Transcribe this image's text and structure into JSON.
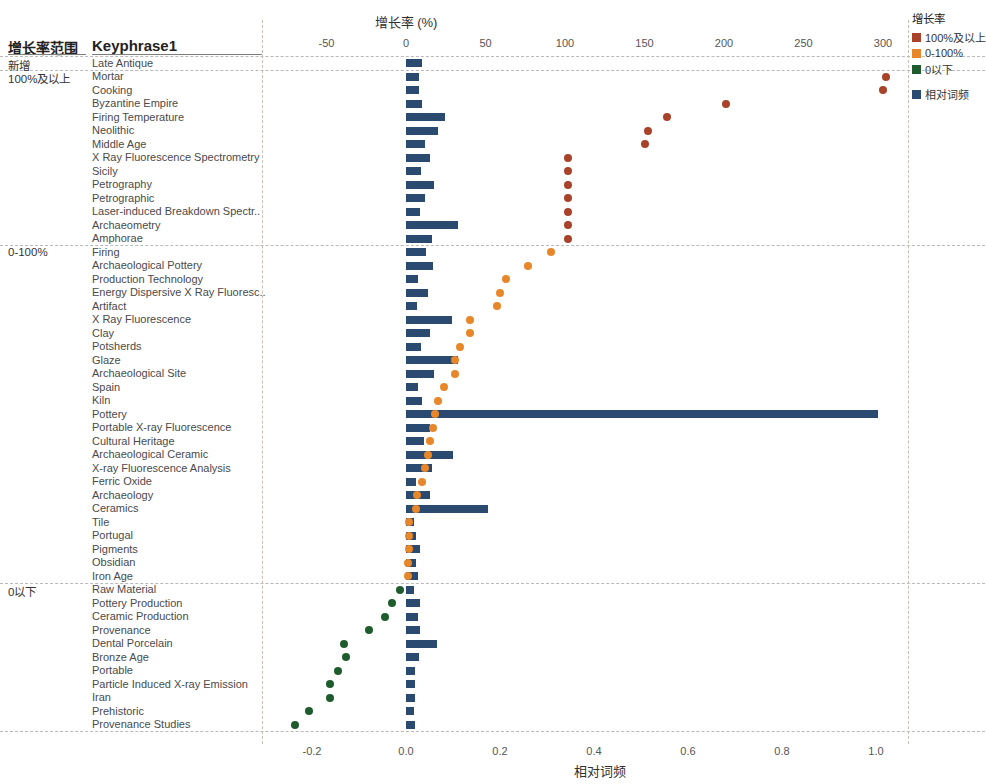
{
  "headers": {
    "range_col": "增长率范围",
    "keyphrase_col": "Keyphrase1"
  },
  "axes": {
    "top_title": "增长率 (%)",
    "bottom_title": "相对词频",
    "top_ticks": [
      "-50",
      "0",
      "50",
      "100",
      "150",
      "200",
      "250",
      "300"
    ],
    "bottom_ticks": [
      "-0.2",
      "0.0",
      "0.2",
      "0.4",
      "0.6",
      "0.8",
      "1.0"
    ]
  },
  "legend": {
    "title": "增长率",
    "items": [
      {
        "label": "100%及以上",
        "color": "#a8432a"
      },
      {
        "label": "0-100%",
        "color": "#e8862a"
      },
      {
        "label": "0以下",
        "color": "#1e5c2e"
      },
      {
        "label": "相对词频",
        "color": "#2b4a6f"
      }
    ]
  },
  "groups": [
    {
      "label": "新增"
    },
    {
      "label": "100%及以上"
    },
    {
      "label": "0-100%"
    },
    {
      "label": "0以下"
    }
  ],
  "chart_data": {
    "type": "bar",
    "xlabel_top": "增长率 (%)",
    "xlabel_bottom": "相对词频",
    "ylabel": "Keyphrase1",
    "xlim_top": [
      -75,
      310
    ],
    "xlim_bottom": [
      -0.29,
      1.08
    ],
    "grid": false,
    "legend_position": "right",
    "series": [
      {
        "name": "相对词频",
        "color": "#2b4a6f",
        "type": "bar"
      },
      {
        "name": "增长率",
        "color_high": "#a8432a",
        "color_mid": "#e8862a",
        "color_low": "#1e5c2e",
        "type": "scatter"
      }
    ],
    "rows": [
      {
        "group": "新增",
        "keyphrase": "Late Antique",
        "freq": 0.035,
        "growth": null,
        "gcolor": "none"
      },
      {
        "group": "100%及以上",
        "keyphrase": "Mortar",
        "freq": 0.028,
        "growth": 302,
        "gcolor": "high"
      },
      {
        "group": "100%及以上",
        "keyphrase": "Cooking",
        "freq": 0.028,
        "growth": 300,
        "gcolor": "high"
      },
      {
        "group": "100%及以上",
        "keyphrase": "Byzantine Empire",
        "freq": 0.034,
        "growth": 201,
        "gcolor": "high"
      },
      {
        "group": "100%及以上",
        "keyphrase": "Firing Temperature",
        "freq": 0.083,
        "growth": 164,
        "gcolor": "high"
      },
      {
        "group": "100%及以上",
        "keyphrase": "Neolithic",
        "freq": 0.068,
        "growth": 152,
        "gcolor": "high"
      },
      {
        "group": "100%及以上",
        "keyphrase": "Middle Age",
        "freq": 0.04,
        "growth": 150,
        "gcolor": "high"
      },
      {
        "group": "100%及以上",
        "keyphrase": "X Ray Fluorescence Spectrometry",
        "freq": 0.05,
        "growth": 102,
        "gcolor": "high"
      },
      {
        "group": "100%及以上",
        "keyphrase": "Sicily",
        "freq": 0.032,
        "growth": 102,
        "gcolor": "high"
      },
      {
        "group": "100%及以上",
        "keyphrase": "Petrography",
        "freq": 0.06,
        "growth": 102,
        "gcolor": "high"
      },
      {
        "group": "100%及以上",
        "keyphrase": "Petrographic",
        "freq": 0.04,
        "growth": 102,
        "gcolor": "high"
      },
      {
        "group": "100%及以上",
        "keyphrase": "Laser-induced Breakdown Spectr..",
        "freq": 0.03,
        "growth": 102,
        "gcolor": "high"
      },
      {
        "group": "100%及以上",
        "keyphrase": "Archaeometry",
        "freq": 0.11,
        "growth": 102,
        "gcolor": "high"
      },
      {
        "group": "100%及以上",
        "keyphrase": "Amphorae",
        "freq": 0.055,
        "growth": 102,
        "gcolor": "high"
      },
      {
        "group": "0-100%",
        "keyphrase": "Firing",
        "freq": 0.043,
        "growth": 91,
        "gcolor": "mid"
      },
      {
        "group": "0-100%",
        "keyphrase": "Archaeological Pottery",
        "freq": 0.057,
        "growth": 77,
        "gcolor": "mid"
      },
      {
        "group": "0-100%",
        "keyphrase": "Production Technology",
        "freq": 0.026,
        "growth": 63,
        "gcolor": "mid"
      },
      {
        "group": "0-100%",
        "keyphrase": "Energy Dispersive X Ray Fluoresc..",
        "freq": 0.047,
        "growth": 59,
        "gcolor": "mid"
      },
      {
        "group": "0-100%",
        "keyphrase": "Artifact",
        "freq": 0.024,
        "growth": 57,
        "gcolor": "mid"
      },
      {
        "group": "0-100%",
        "keyphrase": "X Ray Fluorescence",
        "freq": 0.097,
        "growth": 40,
        "gcolor": "mid"
      },
      {
        "group": "0-100%",
        "keyphrase": "Clay",
        "freq": 0.052,
        "growth": 40,
        "gcolor": "mid"
      },
      {
        "group": "0-100%",
        "keyphrase": "Potsherds",
        "freq": 0.032,
        "growth": 34,
        "gcolor": "mid"
      },
      {
        "group": "0-100%",
        "keyphrase": "Glaze",
        "freq": 0.11,
        "growth": 31,
        "gcolor": "mid"
      },
      {
        "group": "0-100%",
        "keyphrase": "Archaeological Site",
        "freq": 0.06,
        "growth": 31,
        "gcolor": "mid"
      },
      {
        "group": "0-100%",
        "keyphrase": "Spain",
        "freq": 0.025,
        "growth": 24,
        "gcolor": "mid"
      },
      {
        "group": "0-100%",
        "keyphrase": "Kiln",
        "freq": 0.033,
        "growth": 20,
        "gcolor": "mid"
      },
      {
        "group": "0-100%",
        "keyphrase": "Pottery",
        "freq": 1.005,
        "growth": 18,
        "gcolor": "mid"
      },
      {
        "group": "0-100%",
        "keyphrase": "Portable X-ray Fluorescence",
        "freq": 0.05,
        "growth": 17,
        "gcolor": "mid"
      },
      {
        "group": "0-100%",
        "keyphrase": "Cultural Heritage",
        "freq": 0.038,
        "growth": 15,
        "gcolor": "mid"
      },
      {
        "group": "0-100%",
        "keyphrase": "Archaeological Ceramic",
        "freq": 0.1,
        "growth": 14,
        "gcolor": "mid"
      },
      {
        "group": "0-100%",
        "keyphrase": "X-ray Fluorescence Analysis",
        "freq": 0.055,
        "growth": 12,
        "gcolor": "mid"
      },
      {
        "group": "0-100%",
        "keyphrase": "Ferric Oxide",
        "freq": 0.022,
        "growth": 10,
        "gcolor": "mid"
      },
      {
        "group": "0-100%",
        "keyphrase": "Archaeology",
        "freq": 0.05,
        "growth": 7,
        "gcolor": "mid"
      },
      {
        "group": "0-100%",
        "keyphrase": "Ceramics",
        "freq": 0.175,
        "growth": 6,
        "gcolor": "mid"
      },
      {
        "group": "0-100%",
        "keyphrase": "Tile",
        "freq": 0.018,
        "growth": 2,
        "gcolor": "mid"
      },
      {
        "group": "0-100%",
        "keyphrase": "Portugal",
        "freq": 0.021,
        "growth": 2,
        "gcolor": "mid"
      },
      {
        "group": "0-100%",
        "keyphrase": "Pigments",
        "freq": 0.03,
        "growth": 2,
        "gcolor": "mid"
      },
      {
        "group": "0-100%",
        "keyphrase": "Obsidian",
        "freq": 0.022,
        "growth": 1,
        "gcolor": "mid"
      },
      {
        "group": "0-100%",
        "keyphrase": "Iron Age",
        "freq": 0.026,
        "growth": 1,
        "gcolor": "mid"
      },
      {
        "group": "0以下",
        "keyphrase": "Raw Material",
        "freq": 0.018,
        "growth": -4,
        "gcolor": "low"
      },
      {
        "group": "0以下",
        "keyphrase": "Pottery Production",
        "freq": 0.03,
        "growth": -9,
        "gcolor": "low"
      },
      {
        "group": "0以下",
        "keyphrase": "Ceramic Production",
        "freq": 0.026,
        "growth": -13,
        "gcolor": "low"
      },
      {
        "group": "0以下",
        "keyphrase": "Provenance",
        "freq": 0.03,
        "growth": -23,
        "gcolor": "low"
      },
      {
        "group": "0以下",
        "keyphrase": "Dental Porcelain",
        "freq": 0.065,
        "growth": -39,
        "gcolor": "low"
      },
      {
        "group": "0以下",
        "keyphrase": "Bronze Age",
        "freq": 0.028,
        "growth": -38,
        "gcolor": "low"
      },
      {
        "group": "0以下",
        "keyphrase": "Portable",
        "freq": 0.02,
        "growth": -43,
        "gcolor": "low"
      },
      {
        "group": "0以下",
        "keyphrase": "Particle Induced X-ray Emission",
        "freq": 0.02,
        "growth": -48,
        "gcolor": "low"
      },
      {
        "group": "0以下",
        "keyphrase": "Iran",
        "freq": 0.02,
        "growth": -48,
        "gcolor": "low"
      },
      {
        "group": "0以下",
        "keyphrase": "Prehistoric",
        "freq": 0.018,
        "growth": -61,
        "gcolor": "low"
      },
      {
        "group": "0以下",
        "keyphrase": "Provenance Studies",
        "freq": 0.02,
        "growth": -70,
        "gcolor": "low"
      }
    ]
  }
}
